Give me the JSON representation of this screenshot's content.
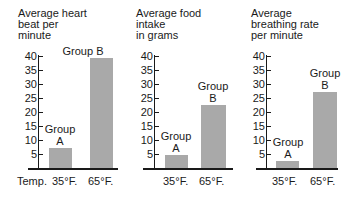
{
  "chart_data": [
    {
      "type": "bar",
      "title": "Average heart beat per minute",
      "title_lines": "Average heart\nbeat per\nminute",
      "xlabel": "Temp.",
      "ylabel": "",
      "categories": [
        "35°F.",
        "65°F."
      ],
      "group_labels": [
        "Group\nA",
        "Group B"
      ],
      "values": [
        7,
        39
      ],
      "ylim": [
        0,
        40
      ],
      "yticks": [
        5,
        10,
        15,
        20,
        25,
        30,
        35,
        40
      ],
      "grid": false
    },
    {
      "type": "bar",
      "title": "Average food intake in grams",
      "title_lines": "Average food\nintake\nin grams",
      "xlabel": "",
      "ylabel": "",
      "categories": [
        "35°F.",
        "65°F."
      ],
      "group_labels": [
        "Group\nA",
        "Group\nB"
      ],
      "values": [
        4.5,
        22
      ],
      "ylim": [
        0,
        40
      ],
      "yticks": [
        5,
        10,
        15,
        20,
        25,
        30,
        35,
        40
      ],
      "grid": false
    },
    {
      "type": "bar",
      "title": "Average breathing rate per minute",
      "title_lines": "Average\nbreathing rate\nper minute",
      "xlabel": "",
      "ylabel": "",
      "categories": [
        "35°F.",
        "65°F."
      ],
      "group_labels": [
        "Group\nA",
        "Group\nB"
      ],
      "values": [
        2.5,
        27
      ],
      "ylim": [
        0,
        40
      ],
      "yticks": [
        5,
        10,
        15,
        20,
        25,
        30,
        35,
        40
      ],
      "grid": false
    }
  ],
  "colors": {
    "bar": "#a9a9a9",
    "axis": "#1a1a1a"
  }
}
